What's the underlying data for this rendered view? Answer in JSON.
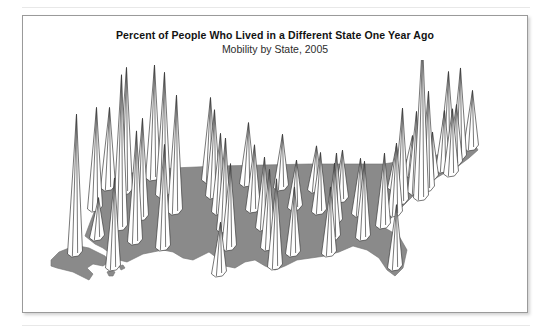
{
  "figure": {
    "title": "Percent of People Who Lived in a Different State One Year Ago",
    "subtitle": "Mobility by State, 2005"
  },
  "colors": {
    "base_fill": "#8a8a8a",
    "base_stroke": "#6f6f6f",
    "spike_fill": "#ffffff",
    "spike_stroke": "#3c3c3c",
    "card_border": "#9a9a9a",
    "page_rule": "#e8e8e8",
    "title_text": "#121212",
    "subtitle_text": "#2c2c2c",
    "background": "#ffffff"
  },
  "chart_data": {
    "type": "bar",
    "render": "3d-spike-map",
    "title": "Percent of People Who Lived in a Different State One Year Ago",
    "subtitle": "Mobility by State, 2005",
    "xlabel": "",
    "ylabel": "Percent of people who lived in a different state one year ago",
    "grid": false,
    "legend": false,
    "units": "percent",
    "value_range": [
      1.2,
      8.1
    ],
    "categories": [
      "Alaska",
      "Hawaii",
      "Washington",
      "Oregon",
      "California",
      "Nevada",
      "Idaho",
      "Montana",
      "Wyoming",
      "Utah",
      "Arizona",
      "New Mexico",
      "Colorado",
      "North Dakota",
      "South Dakota",
      "Nebraska",
      "Kansas",
      "Oklahoma",
      "Texas",
      "Minnesota",
      "Iowa",
      "Missouri",
      "Arkansas",
      "Louisiana",
      "Wisconsin",
      "Illinois",
      "Mississippi",
      "Michigan",
      "Indiana",
      "Kentucky",
      "Tennessee",
      "Alabama",
      "Ohio",
      "Georgia",
      "Florida",
      "West Virginia",
      "South Carolina",
      "North Carolina",
      "Virginia",
      "Pennsylvania",
      "New York",
      "Maryland",
      "Delaware",
      "District of Columbia",
      "New Jersey",
      "Connecticut",
      "Rhode Island",
      "Massachusetts",
      "Vermont",
      "New Hampshire",
      "Maine"
    ],
    "values": [
      7.2,
      4.6,
      4.1,
      5.2,
      2.0,
      7.9,
      6.4,
      5.8,
      6.3,
      5.1,
      5.7,
      5.3,
      6.0,
      4.2,
      4.4,
      4.0,
      4.7,
      4.3,
      2.6,
      3.1,
      3.3,
      3.6,
      4.0,
      4.5,
      2.7,
      2.4,
      3.4,
      2.2,
      3.0,
      3.5,
      3.8,
      3.4,
      2.5,
      3.9,
      3.2,
      2.8,
      3.7,
      3.6,
      4.8,
      2.1,
      1.9,
      4.1,
      5.0,
      8.1,
      2.3,
      3.0,
      3.3,
      3.0,
      4.2,
      4.6,
      2.9
    ]
  },
  "geometry": {
    "view": "oblique-3d",
    "base_fill_opacity": 1,
    "spike_line_width": 0.7
  }
}
